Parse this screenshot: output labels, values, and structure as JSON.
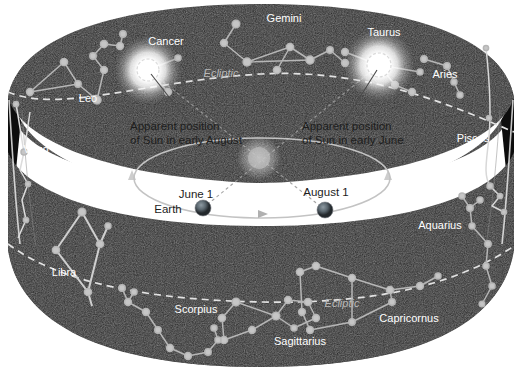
{
  "figure": {
    "background_color": "#ffffff",
    "band_color": "#262626",
    "band_inner_color": "#141414",
    "star_color": "#b6b6b6",
    "label_color": "#ffffff",
    "dark_label_color": "#1d1d1d",
    "ecliptic_label_color": "#b9b9b9",
    "sun_glow_color": "#ffffff"
  },
  "constellations": [
    {
      "name": "Leo",
      "label_x": 88,
      "label_y": 102,
      "anchor": "middle",
      "size": 11
    },
    {
      "name": "Cancer",
      "label_x": 166,
      "label_y": 45,
      "anchor": "middle",
      "size": 11
    },
    {
      "name": "Gemini",
      "label_x": 284,
      "label_y": 22,
      "anchor": "middle",
      "size": 11
    },
    {
      "name": "Taurus",
      "label_x": 384,
      "label_y": 36,
      "anchor": "middle",
      "size": 11
    },
    {
      "name": "Aries",
      "label_x": 445,
      "label_y": 78,
      "anchor": "middle",
      "size": 11
    },
    {
      "name": "Pisces",
      "label_x": 473,
      "label_y": 142,
      "anchor": "middle",
      "size": 11
    },
    {
      "name": "Aquarius",
      "label_x": 440,
      "label_y": 229,
      "anchor": "middle",
      "size": 11
    },
    {
      "name": "Capricornus",
      "label_x": 409,
      "label_y": 322,
      "anchor": "middle",
      "size": 11
    },
    {
      "name": "Sagittarius",
      "label_x": 300,
      "label_y": 345,
      "anchor": "middle",
      "size": 11
    },
    {
      "name": "Scorpius",
      "label_x": 196,
      "label_y": 313,
      "anchor": "middle",
      "size": 11
    },
    {
      "name": "Libra",
      "label_x": 64,
      "label_y": 276,
      "anchor": "middle",
      "size": 11
    },
    {
      "name": "Virgo",
      "label_x": 36,
      "label_y": 153,
      "anchor": "middle",
      "size": 11
    }
  ],
  "ecliptic": {
    "label": "Ecliptic",
    "top_label_x": 221,
    "top_label_y": 77,
    "bottom_label_x": 342,
    "bottom_label_y": 307
  },
  "callouts": [
    {
      "id": "august",
      "line1": "Apparent position",
      "line2": "of Sun in early August",
      "text_x": 130,
      "text_y1": 130,
      "text_y2": 143,
      "leader": {
        "x1": 151,
        "y1": 74,
        "x2": 190,
        "y2": 124
      }
    },
    {
      "id": "june",
      "line1": "Apparent position",
      "line2": "of Sun in early June",
      "text_x": 302,
      "text_y1": 130,
      "text_y2": 143,
      "leader": {
        "x1": 377,
        "y1": 70,
        "x2": 343,
        "y2": 124
      }
    }
  ],
  "earth_positions": [
    {
      "date_label": "June 1",
      "body_label": "Earth",
      "date_x": 196,
      "date_y": 197,
      "body_x": 170,
      "body_y": 212,
      "globe_x": 203,
      "globe_y": 208
    },
    {
      "date_label": "August 1",
      "body_label": "",
      "date_x": 326,
      "date_y": 195,
      "body_x": 0,
      "body_y": 0,
      "globe_x": 325,
      "globe_y": 210
    }
  ],
  "sun_apparent_positions": [
    {
      "name": "sun-in-cancer",
      "x": 148,
      "y": 70,
      "radius": 17
    },
    {
      "name": "sun-in-taurus",
      "x": 379,
      "y": 65,
      "radius": 18
    }
  ],
  "central_sun": {
    "x": 259,
    "y": 158,
    "radius": 19
  },
  "orbit": {
    "cx": 262,
    "cy": 178,
    "rx": 128,
    "ry": 40
  }
}
